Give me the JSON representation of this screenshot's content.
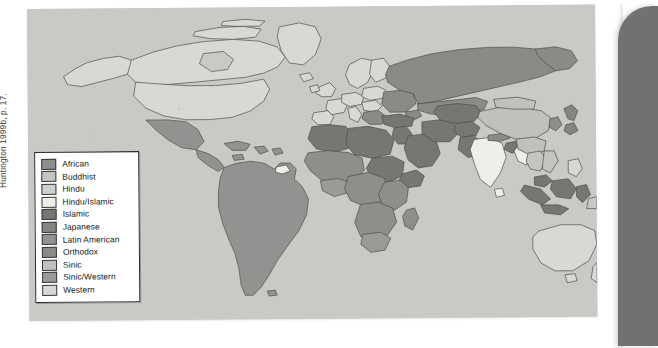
{
  "figure": {
    "source_note": "Huntington 1999b, p. 17.",
    "panel_background": "#c9cac6",
    "page_edge_color": "#6f7173"
  },
  "legend": {
    "title": "",
    "items": [
      {
        "label": "African",
        "color": "#8e8f8b"
      },
      {
        "label": "Buddhist",
        "color": "#c4c5c1"
      },
      {
        "label": "Hindu",
        "color": "#cfd0cc"
      },
      {
        "label": "Hindu/Islamic",
        "color": "#efefe9"
      },
      {
        "label": "Islamic",
        "color": "#767773"
      },
      {
        "label": "Japanese",
        "color": "#858682"
      },
      {
        "label": "Latin American",
        "color": "#929390"
      },
      {
        "label": "Orthodox",
        "color": "#8a8b87"
      },
      {
        "label": "Sinic",
        "color": "#c0c1bd"
      },
      {
        "label": "Sinic/Western",
        "color": "#9a9b97"
      },
      {
        "label": "Western",
        "color": "#d8d9d4"
      }
    ]
  },
  "map": {
    "type": "choropleth-world",
    "ocean_color": "#c9cac6",
    "border_color": "#4e4f4b",
    "regions": [
      {
        "name": "north-america",
        "civilization": "Western",
        "color": "#d8d9d4"
      },
      {
        "name": "greenland",
        "civilization": "Western",
        "color": "#d8d9d4"
      },
      {
        "name": "mexico",
        "civilization": "Latin American",
        "color": "#929390"
      },
      {
        "name": "central-america",
        "civilization": "Latin American",
        "color": "#929390"
      },
      {
        "name": "south-america",
        "civilization": "Latin American",
        "color": "#929390"
      },
      {
        "name": "guyana",
        "civilization": "Western",
        "color": "#efefe9"
      },
      {
        "name": "western-europe",
        "civilization": "Western",
        "color": "#d8d9d4"
      },
      {
        "name": "scandinavia",
        "civilization": "Western",
        "color": "#d8d9d4"
      },
      {
        "name": "eastern-europe",
        "civilization": "Orthodox",
        "color": "#8a8b87"
      },
      {
        "name": "russia",
        "civilization": "Orthodox",
        "color": "#8a8b87"
      },
      {
        "name": "turkey",
        "civilization": "Islamic",
        "color": "#767773"
      },
      {
        "name": "north-africa",
        "civilization": "Islamic",
        "color": "#767773"
      },
      {
        "name": "middle-east",
        "civilization": "Islamic",
        "color": "#767773"
      },
      {
        "name": "central-asia",
        "civilization": "Islamic",
        "color": "#767773"
      },
      {
        "name": "pakistan",
        "civilization": "Islamic",
        "color": "#767773"
      },
      {
        "name": "india",
        "civilization": "Hindu",
        "color": "#efefe9"
      },
      {
        "name": "sub-saharan-africa",
        "civilization": "African",
        "color": "#8e8f8b"
      },
      {
        "name": "horn-of-africa",
        "civilization": "Islamic",
        "color": "#767773"
      },
      {
        "name": "south-africa",
        "civilization": "African",
        "color": "#9a9b97"
      },
      {
        "name": "china",
        "civilization": "Sinic",
        "color": "#c0c1bd"
      },
      {
        "name": "mongolia",
        "civilization": "Sinic",
        "color": "#c0c1bd"
      },
      {
        "name": "japan",
        "civilization": "Japanese",
        "color": "#858682"
      },
      {
        "name": "korea",
        "civilization": "Sinic",
        "color": "#8e8f8b"
      },
      {
        "name": "southeast-asia",
        "civilization": "Buddhist",
        "color": "#c4c5c1"
      },
      {
        "name": "indonesia",
        "civilization": "Islamic",
        "color": "#767773"
      },
      {
        "name": "philippines",
        "civilization": "Western",
        "color": "#d8d9d4"
      },
      {
        "name": "australia",
        "civilization": "Western",
        "color": "#d8d9d4"
      },
      {
        "name": "new-zealand",
        "civilization": "Western",
        "color": "#d8d9d4"
      },
      {
        "name": "myanmar",
        "civilization": "Buddhist",
        "color": "#efefe9"
      }
    ]
  }
}
